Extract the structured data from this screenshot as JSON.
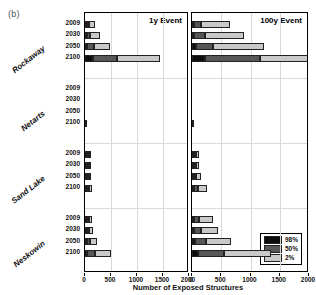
{
  "figure": {
    "panel_label": "(b)",
    "xaxis_title": "Number of Exposed Structures"
  },
  "legend": {
    "title": "",
    "entries": [
      {
        "label": "98%",
        "color": "#0d0d0d"
      },
      {
        "label": "50%",
        "color": "#575757"
      },
      {
        "label": "2%",
        "color": "#c9c9c9"
      }
    ]
  },
  "chart_data": {
    "type": "bar",
    "orientation": "horizontal",
    "stacked": true,
    "xlabel": "Number of Exposed Structures",
    "ylabel": "",
    "xlim": [
      0,
      2000
    ],
    "xticks": [
      0,
      500,
      1000,
      1500,
      2000
    ],
    "grid": true,
    "legend_position": "bottom-right",
    "groups": [
      "Rockaway",
      "Netarts",
      "Sand Lake",
      "Neskowin"
    ],
    "years": [
      "2009",
      "2030",
      "2050",
      "2100"
    ],
    "series": [
      {
        "name": "98%",
        "color": "#0d0d0d"
      },
      {
        "name": "50%",
        "color": "#575757"
      },
      {
        "name": "2%",
        "color": "#c9c9c9"
      }
    ],
    "panels": [
      {
        "name": "1y Event",
        "title": "1y Event",
        "rows": [
          {
            "group": "Rockaway",
            "year": "2009",
            "values": {
              "98%": 5,
              "50%": 30,
              "2%": 120
            }
          },
          {
            "group": "Rockaway",
            "year": "2030",
            "values": {
              "98%": 20,
              "50%": 60,
              "2%": 185
            }
          },
          {
            "group": "Rockaway",
            "year": "2050",
            "values": {
              "98%": 30,
              "50%": 130,
              "2%": 310
            }
          },
          {
            "group": "Rockaway",
            "year": "2100",
            "values": {
              "98%": 160,
              "50%": 450,
              "2%": 830
            }
          },
          {
            "group": "Netarts",
            "year": "2009",
            "values": {
              "98%": 0,
              "50%": 0,
              "2%": 0
            }
          },
          {
            "group": "Netarts",
            "year": "2030",
            "values": {
              "98%": 0,
              "50%": 0,
              "2%": 0
            }
          },
          {
            "group": "Netarts",
            "year": "2050",
            "values": {
              "98%": 0,
              "50%": 0,
              "2%": 0
            }
          },
          {
            "group": "Netarts",
            "year": "2100",
            "values": {
              "98%": 0,
              "50%": 0,
              "2%": 5
            }
          },
          {
            "group": "Sand Lake",
            "year": "2009",
            "values": {
              "98%": 2,
              "50%": 8,
              "2%": 22
            }
          },
          {
            "group": "Sand Lake",
            "year": "2030",
            "values": {
              "98%": 4,
              "50%": 12,
              "2%": 28
            }
          },
          {
            "group": "Sand Lake",
            "year": "2050",
            "values": {
              "98%": 6,
              "50%": 16,
              "2%": 34
            }
          },
          {
            "group": "Sand Lake",
            "year": "2100",
            "values": {
              "98%": 12,
              "50%": 30,
              "2%": 62
            }
          },
          {
            "group": "Neskowin",
            "year": "2009",
            "values": {
              "98%": 8,
              "50%": 22,
              "2%": 58
            }
          },
          {
            "group": "Neskowin",
            "year": "2030",
            "values": {
              "98%": 14,
              "50%": 36,
              "2%": 86
            }
          },
          {
            "group": "Neskowin",
            "year": "2050",
            "values": {
              "98%": 22,
              "50%": 58,
              "2%": 130
            }
          },
          {
            "group": "Neskowin",
            "year": "2100",
            "values": {
              "98%": 45,
              "50%": 150,
              "2%": 300
            }
          }
        ]
      },
      {
        "name": "100y Event",
        "title": "100y Event",
        "rows": [
          {
            "group": "Rockaway",
            "year": "2009",
            "values": {
              "98%": 20,
              "50%": 125,
              "2%": 490
            }
          },
          {
            "group": "Rockaway",
            "year": "2030",
            "values": {
              "98%": 30,
              "50%": 195,
              "2%": 660
            }
          },
          {
            "group": "Rockaway",
            "year": "2050",
            "values": {
              "98%": 60,
              "50%": 300,
              "2%": 870
            }
          },
          {
            "group": "Rockaway",
            "year": "2100",
            "values": {
              "98%": 215,
              "50%": 950,
              "2%": 1790
            }
          },
          {
            "group": "Netarts",
            "year": "2009",
            "values": {
              "98%": 0,
              "50%": 0,
              "2%": 0
            }
          },
          {
            "group": "Netarts",
            "year": "2030",
            "values": {
              "98%": 0,
              "50%": 0,
              "2%": 0
            }
          },
          {
            "group": "Netarts",
            "year": "2050",
            "values": {
              "98%": 0,
              "50%": 0,
              "2%": 0
            }
          },
          {
            "group": "Netarts",
            "year": "2100",
            "values": {
              "98%": 0,
              "50%": 0,
              "2%": 8
            }
          },
          {
            "group": "Sand Lake",
            "year": "2009",
            "values": {
              "98%": 8,
              "50%": 22,
              "2%": 48
            }
          },
          {
            "group": "Sand Lake",
            "year": "2030",
            "values": {
              "98%": 10,
              "50%": 28,
              "2%": 58
            }
          },
          {
            "group": "Sand Lake",
            "year": "2050",
            "values": {
              "98%": 14,
              "50%": 38,
              "2%": 74
            }
          },
          {
            "group": "Sand Lake",
            "year": "2100",
            "values": {
              "98%": 30,
              "50%": 72,
              "2%": 150
            }
          },
          {
            "group": "Neskowin",
            "year": "2009",
            "values": {
              "98%": 20,
              "50%": 90,
              "2%": 235
            }
          },
          {
            "group": "Neskowin",
            "year": "2030",
            "values": {
              "98%": 30,
              "50%": 120,
              "2%": 290
            }
          },
          {
            "group": "Neskowin",
            "year": "2050",
            "values": {
              "98%": 55,
              "50%": 190,
              "2%": 420
            }
          },
          {
            "group": "Neskowin",
            "year": "2100",
            "values": {
              "98%": 95,
              "50%": 460,
              "2%": 790
            }
          }
        ]
      }
    ]
  }
}
